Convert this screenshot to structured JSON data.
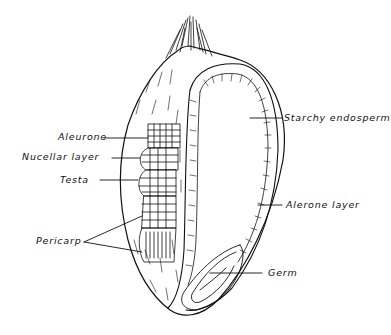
{
  "diagram": {
    "labels": {
      "aleurone": "Aleurone",
      "nucellar_layer": "Nucellar layer",
      "testa": "Testa",
      "pericarp": "Pericarp",
      "starchy_endosperm": "Starchy endosperm",
      "alerone_layer": "Alerone layer",
      "germ": "Germ"
    },
    "colors": {
      "ink": "#111111",
      "background": "#ffffff"
    }
  }
}
